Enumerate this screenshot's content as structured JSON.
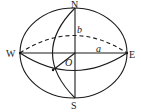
{
  "figure": {
    "type": "ellipsoid-diagram",
    "labels": {
      "north": "N",
      "south": "S",
      "west": "W",
      "east": "E",
      "center": "O",
      "semi_minor": "b",
      "semi_major": "a"
    },
    "colors": {
      "stroke": "#1a1a1a",
      "background": "#ffffff"
    }
  }
}
